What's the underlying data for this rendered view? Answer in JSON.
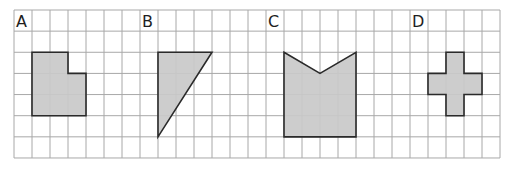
{
  "grid": {
    "origin_x": 14,
    "origin_y": 10,
    "cols": 27,
    "rows": 7,
    "cell_w": 18,
    "cell_h": 21.14,
    "line_color": "#a8a8a8"
  },
  "colors": {
    "shape_fill": "#c9c9c9",
    "shape_stroke": "#2a2a2a",
    "label": "#1e1e1e"
  },
  "shapes": [
    {
      "label": "A",
      "label_cell": [
        0,
        0
      ],
      "name": "shape-a",
      "kind": "L-shaped polygon",
      "vertices": [
        [
          1,
          2
        ],
        [
          3,
          2
        ],
        [
          3,
          3
        ],
        [
          4,
          3
        ],
        [
          4,
          5
        ],
        [
          1,
          5
        ]
      ]
    },
    {
      "label": "B",
      "label_cell": [
        7,
        0
      ],
      "name": "shape-b",
      "kind": "right triangle",
      "vertices": [
        [
          8,
          2
        ],
        [
          11,
          2
        ],
        [
          8,
          6
        ]
      ]
    },
    {
      "label": "C",
      "label_cell": [
        14,
        0
      ],
      "name": "shape-c",
      "kind": "notched pentagon",
      "vertices": [
        [
          15,
          2
        ],
        [
          17,
          3
        ],
        [
          19,
          2
        ],
        [
          19,
          6
        ],
        [
          15,
          6
        ]
      ]
    },
    {
      "label": "D",
      "label_cell": [
        22,
        0
      ],
      "name": "shape-d",
      "kind": "cross",
      "vertices": [
        [
          24,
          2
        ],
        [
          25,
          2
        ],
        [
          25,
          3
        ],
        [
          26,
          3
        ],
        [
          26,
          4
        ],
        [
          25,
          4
        ],
        [
          25,
          5
        ],
        [
          24,
          5
        ],
        [
          24,
          4
        ],
        [
          23,
          4
        ],
        [
          23,
          3
        ],
        [
          24,
          3
        ]
      ]
    }
  ]
}
